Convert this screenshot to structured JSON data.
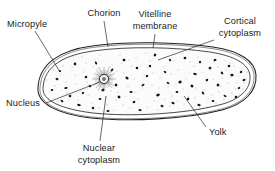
{
  "figure": {
    "background_color": "#ffffff",
    "ink_color": "#1b1b1b"
  },
  "labels": {
    "micropyle": {
      "line1": "Micropyle",
      "line2": ""
    },
    "chorion": {
      "line1": "Chorion",
      "line2": ""
    },
    "vitelline_membrane": {
      "line1": "Vitelline",
      "line2": "membrane"
    },
    "cortical_cytoplasm": {
      "line1": "Cortical",
      "line2": "cytoplasm"
    },
    "nucleus": {
      "line1": "Nucleus",
      "line2": ""
    },
    "nuclear_cytoplasm": {
      "line1": "Nuclear",
      "line2": "cytoplasm"
    },
    "yolk": {
      "line1": "Yolk",
      "line2": ""
    }
  },
  "structures": {
    "egg_outline": "elongated-oval",
    "membrane_layers": [
      "chorion",
      "vitelline membrane"
    ],
    "interior_texture": "stippled cytoplasm with dark yolk granules",
    "nucleus_position": "left-of-center"
  }
}
